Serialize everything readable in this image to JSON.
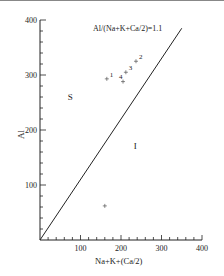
{
  "chart_data": {
    "type": "scatter",
    "title": "",
    "xlabel": "Na+K+(Ca/2)",
    "ylabel": "Al",
    "xlim": [
      0,
      400
    ],
    "ylim": [
      0,
      400
    ],
    "x_ticks": [
      "100",
      "200",
      "300",
      "400"
    ],
    "y_ticks": [
      "100",
      "200",
      "300",
      "400"
    ],
    "grid": false,
    "line": {
      "label": "Al/(Na+K+Ca/2)=1.1",
      "slope": 1.1,
      "x": [
        0,
        350
      ],
      "y": [
        0,
        385
      ]
    },
    "regions": [
      {
        "label": "S",
        "x": 75,
        "y": 255
      },
      {
        "label": "I",
        "x": 235,
        "y": 165
      }
    ],
    "points": [
      {
        "label": "1",
        "x": 165,
        "y": 293
      },
      {
        "label": "2",
        "x": 237,
        "y": 325
      },
      {
        "label": "3",
        "x": 212,
        "y": 305
      },
      {
        "label": "4",
        "x": 205,
        "y": 288
      },
      {
        "label": "",
        "x": 160,
        "y": 62
      }
    ],
    "marker": "+"
  }
}
